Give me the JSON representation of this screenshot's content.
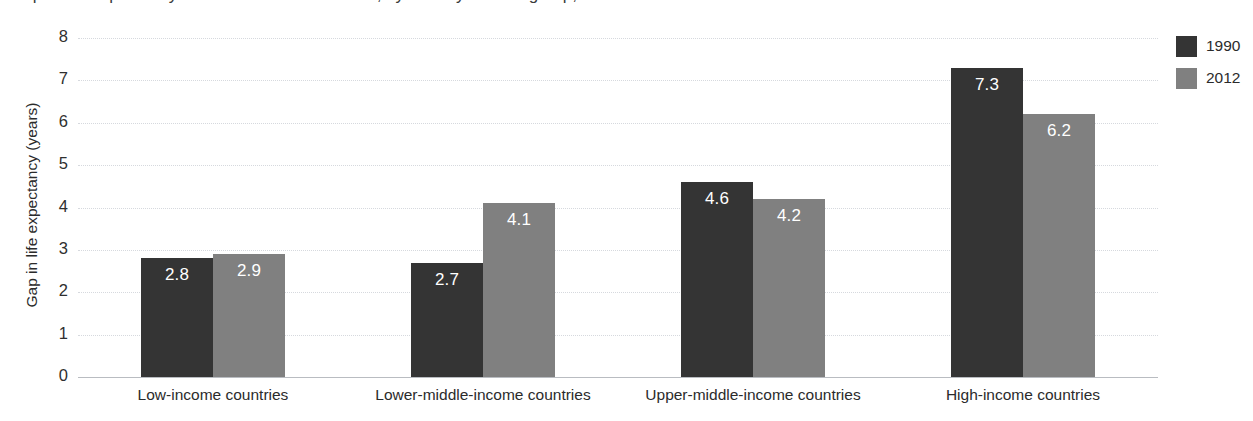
{
  "figure": {
    "title_partial": "Gap in life expectancy between women and men, by country income group, 1990–2012"
  },
  "chart_data": {
    "type": "bar",
    "title": "Gap in life expectancy between women and men, by country income group, 1990–2012",
    "xlabel": "",
    "ylabel": "Gap in life expectancy (years)",
    "ylim": [
      0,
      8
    ],
    "ytick_labels": [
      "8",
      "7",
      "6",
      "5",
      "4",
      "3",
      "2",
      "1",
      "0"
    ],
    "ytick_values": [
      8,
      7,
      6,
      5,
      4,
      3,
      2,
      1,
      0
    ],
    "grid": true,
    "grid_style": "dotted-horizontal",
    "legend_position": "right",
    "categories": [
      "Low-income countries",
      "Lower-middle-income countries",
      "Upper-middle-income countries",
      "High-income countries"
    ],
    "series": [
      {
        "name": "1990",
        "color": "#343434",
        "values": [
          2.8,
          2.7,
          4.6,
          7.3
        ],
        "labels": [
          "2.8",
          "2.7",
          "4.6",
          "7.3"
        ]
      },
      {
        "name": "2012",
        "color": "#808080",
        "values": [
          2.9,
          4.1,
          4.2,
          6.2
        ],
        "labels": [
          "2.9",
          "4.1",
          "4.2",
          "6.2"
        ]
      }
    ],
    "data_label_color": "#ffffff"
  },
  "legend": {
    "entries": [
      {
        "label": "1990",
        "color": "#343434"
      },
      {
        "label": "2012",
        "color": "#808080"
      }
    ]
  }
}
